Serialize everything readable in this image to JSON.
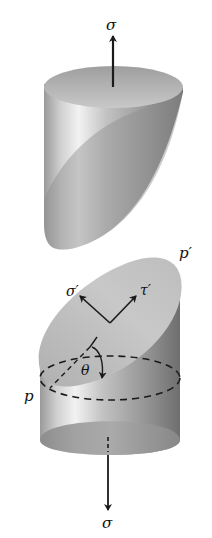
{
  "diagram": {
    "labels": {
      "sigma_top": "σ",
      "sigma_bottom": "σ",
      "sigma_prime": "σ′",
      "tau_prime": "τ′",
      "theta": "θ",
      "p": "p",
      "p_prime": "p′"
    },
    "colors": {
      "body_light": "#e6e6e6",
      "body_mid": "#b8b8b8",
      "body_dark": "#7a7a7a",
      "face": "#c4c4c4",
      "ink": "#1a1a1a"
    }
  }
}
